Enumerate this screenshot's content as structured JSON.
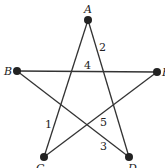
{
  "diagram": {
    "type": "pentagram",
    "vertices": [
      {
        "id": "A",
        "label": "A",
        "x": 88,
        "y": 20,
        "lx": 84,
        "ly": 13
      },
      {
        "id": "B",
        "label": "B",
        "x": 17,
        "y": 71,
        "lx": 4,
        "ly": 75
      },
      {
        "id": "E",
        "label": "E",
        "x": 157,
        "y": 72,
        "lx": 162,
        "ly": 76
      },
      {
        "id": "C",
        "label": "C",
        "x": 44,
        "y": 157,
        "lx": 36,
        "ly": 172
      },
      {
        "id": "D",
        "label": "D",
        "x": 129,
        "y": 157,
        "lx": 128,
        "ly": 172
      }
    ],
    "edges": [
      {
        "from": "A",
        "to": "C"
      },
      {
        "from": "A",
        "to": "D"
      },
      {
        "from": "B",
        "to": "E"
      },
      {
        "from": "B",
        "to": "D"
      },
      {
        "from": "E",
        "to": "C"
      }
    ],
    "edge_labels": [
      {
        "text": "1",
        "x": 45,
        "y": 128
      },
      {
        "text": "2",
        "x": 99,
        "y": 51
      },
      {
        "text": "3",
        "x": 100,
        "y": 150
      },
      {
        "text": "4",
        "x": 84,
        "y": 69
      },
      {
        "text": "5",
        "x": 100,
        "y": 126
      }
    ],
    "line_color": "#333333",
    "dot_color": "#222222"
  }
}
